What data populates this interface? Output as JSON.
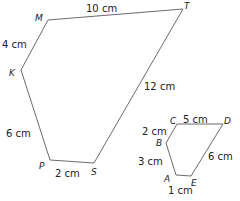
{
  "figures": [
    {
      "name": "large-polygon",
      "vertices": [
        {
          "label": "M",
          "x": 48,
          "y": 20,
          "lx": 35,
          "ly": 21
        },
        {
          "label": "T",
          "x": 183,
          "y": 9,
          "lx": 184,
          "ly": 9
        },
        {
          "label": "S",
          "x": 94,
          "y": 163,
          "lx": 91,
          "ly": 175
        },
        {
          "label": "P",
          "x": 50,
          "y": 160,
          "lx": 39,
          "ly": 169
        },
        {
          "label": "K",
          "x": 21,
          "y": 70,
          "lx": 9,
          "ly": 76
        }
      ],
      "lengths": [
        {
          "text": "10 cm",
          "x": 86,
          "y": 12
        },
        {
          "text": "12 cm",
          "x": 144,
          "y": 90
        },
        {
          "text": "2 cm",
          "x": 55,
          "y": 177
        },
        {
          "text": "6 cm",
          "x": 6,
          "y": 137
        },
        {
          "text": "4 cm",
          "x": 2,
          "y": 48
        }
      ]
    },
    {
      "name": "small-polygon",
      "vertices": [
        {
          "label": "C",
          "x": 177,
          "y": 124,
          "lx": 170,
          "ly": 124
        },
        {
          "label": "D",
          "x": 223,
          "y": 124,
          "lx": 224,
          "ly": 124
        },
        {
          "label": "E",
          "x": 191,
          "y": 176,
          "lx": 191,
          "ly": 186
        },
        {
          "label": "A",
          "x": 176,
          "y": 175,
          "lx": 164,
          "ly": 182
        },
        {
          "label": "B",
          "x": 166,
          "y": 143,
          "lx": 156,
          "ly": 146
        }
      ],
      "lengths": [
        {
          "text": "5 cm",
          "x": 183,
          "y": 123
        },
        {
          "text": "6 cm",
          "x": 208,
          "y": 160
        },
        {
          "text": "1 cm",
          "x": 168,
          "y": 194
        },
        {
          "text": "3 cm",
          "x": 138,
          "y": 165
        },
        {
          "text": "2 cm",
          "x": 142,
          "y": 135
        }
      ]
    }
  ]
}
